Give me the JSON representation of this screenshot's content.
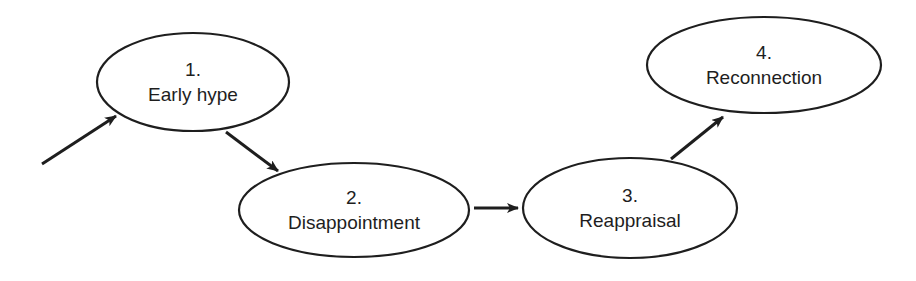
{
  "diagram": {
    "type": "flow",
    "stages": [
      {
        "number": "1.",
        "label": "Early hype",
        "cx": 193,
        "cy": 82,
        "rx": 96,
        "ry": 49
      },
      {
        "number": "2.",
        "label": "Disappointment",
        "cx": 354,
        "cy": 210,
        "rx": 115,
        "ry": 47
      },
      {
        "number": "3.",
        "label": "Reappraisal",
        "cx": 630,
        "cy": 208,
        "rx": 107,
        "ry": 50
      },
      {
        "number": "4.",
        "label": "Reconnection",
        "cx": 764,
        "cy": 65,
        "rx": 117,
        "ry": 48
      }
    ],
    "edges": [
      {
        "from": "start",
        "to": "1",
        "x1": 42,
        "y1": 164,
        "x2": 116,
        "y2": 116
      },
      {
        "from": "1",
        "to": "2",
        "x1": 226,
        "y1": 132,
        "x2": 278,
        "y2": 171
      },
      {
        "from": "2",
        "to": "3",
        "x1": 474,
        "y1": 208,
        "x2": 518,
        "y2": 208
      },
      {
        "from": "3",
        "to": "4",
        "x1": 671,
        "y1": 159,
        "x2": 723,
        "y2": 117
      }
    ],
    "colors": {
      "stroke": "#1e1e1e",
      "background": "#ffffff"
    }
  }
}
